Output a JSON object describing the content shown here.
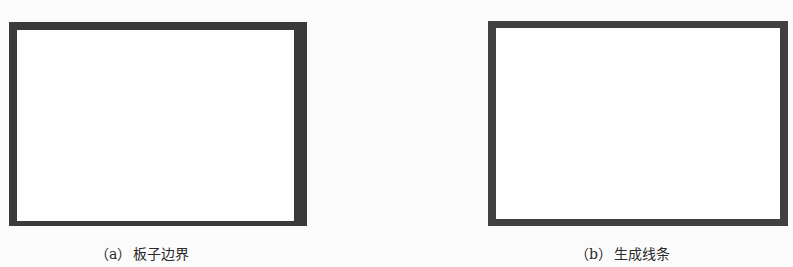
{
  "figure": {
    "panels": [
      {
        "id": "a",
        "label": "（a）",
        "caption": "板子边界",
        "shape": "rectangle-outline",
        "stroke_color": "#3a3a3a",
        "fill_color": "#fefefe"
      },
      {
        "id": "b",
        "label": "（b）",
        "caption": "生成线条",
        "shape": "rectangle-outline",
        "stroke_color": "#404040",
        "fill_color": "#fefefe"
      }
    ]
  }
}
